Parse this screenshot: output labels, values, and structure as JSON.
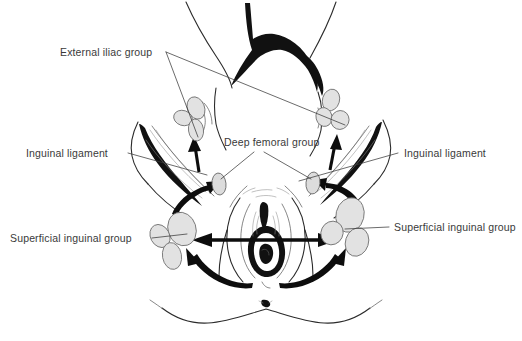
{
  "figure": {
    "background_color": "#ffffff",
    "ink_color": "#2b2b2b",
    "node_fill_color": "#e2e2e2",
    "node_stroke_color": "#6a6a6a",
    "arrow_color": "#0d0d0d",
    "label_color": "#3a3a3a",
    "width": 522,
    "height": 341
  },
  "labels": {
    "external_iliac": "External iliac group",
    "deep_femoral": "Deep femoral group",
    "inguinal_ligament_left": "Inguinal ligament",
    "inguinal_ligament_right": "Inguinal ligament",
    "superficial_inguinal_left": "Superficial inguinal group",
    "superficial_inguinal_right": "Superficial inguinal group"
  },
  "node_groups": [
    {
      "name": "external-iliac-left",
      "label": "External iliac group",
      "side": "left",
      "node_count": 3,
      "nodes": [
        {
          "cx": 196,
          "cy": 108,
          "rx": 8.5,
          "ry": 11.5,
          "rot": -22
        },
        {
          "cx": 183,
          "cy": 118,
          "rx": 9.5,
          "ry": 7.5,
          "rot": 18
        },
        {
          "cx": 196,
          "cy": 130,
          "rx": 7.5,
          "ry": 11.0,
          "rot": -8
        }
      ]
    },
    {
      "name": "external-iliac-right",
      "label": "External iliac group",
      "side": "right",
      "node_count": 3,
      "nodes": [
        {
          "cx": 331,
          "cy": 100,
          "rx": 8.5,
          "ry": 11.0,
          "rot": 16
        },
        {
          "cx": 324,
          "cy": 117,
          "rx": 8.0,
          "ry": 9.5,
          "rot": -14
        },
        {
          "cx": 340,
          "cy": 120,
          "rx": 9.0,
          "ry": 9.5,
          "rot": 22
        }
      ]
    },
    {
      "name": "deep-femoral-left",
      "label": "Deep femoral group",
      "side": "left",
      "node_count": 1,
      "nodes": [
        {
          "cx": 219,
          "cy": 184,
          "rx": 7.0,
          "ry": 11.0,
          "rot": -6
        }
      ]
    },
    {
      "name": "deep-femoral-right",
      "label": "Deep femoral group",
      "side": "right",
      "node_count": 1,
      "nodes": [
        {
          "cx": 313,
          "cy": 183,
          "rx": 7.0,
          "ry": 11.0,
          "rot": 6
        }
      ]
    },
    {
      "name": "superficial-inguinal-left",
      "label": "Superficial inguinal group",
      "side": "left",
      "node_count": 3,
      "nodes": [
        {
          "cx": 182,
          "cy": 229,
          "rx": 14.0,
          "ry": 17.0,
          "rot": -18
        },
        {
          "cx": 160,
          "cy": 236,
          "rx": 9.5,
          "ry": 12.0,
          "rot": -28
        },
        {
          "cx": 172,
          "cy": 256,
          "rx": 9.5,
          "ry": 13.5,
          "rot": -10
        }
      ]
    },
    {
      "name": "superficial-inguinal-right",
      "label": "Superficial inguinal group",
      "side": "right",
      "node_count": 3,
      "nodes": [
        {
          "cx": 350,
          "cy": 215,
          "rx": 14.0,
          "ry": 17.5,
          "rot": 14
        },
        {
          "cx": 332,
          "cy": 233,
          "rx": 11.0,
          "ry": 12.0,
          "rot": 26
        },
        {
          "cx": 357,
          "cy": 242,
          "rx": 11.5,
          "ry": 14.5,
          "rot": 18
        }
      ]
    }
  ],
  "leader_lines": [
    {
      "name": "external-iliac-to-left-nodes",
      "from_x": 166,
      "from_y": 52,
      "to_x": 196,
      "to_y": 136
    },
    {
      "name": "external-iliac-to-right-nodes",
      "from_x": 166,
      "from_y": 52,
      "to_x": 344,
      "to_y": 124
    },
    {
      "name": "deep-femoral-to-left-node",
      "from_x": 252,
      "from_y": 152,
      "to_x": 221,
      "to_y": 180
    },
    {
      "name": "deep-femoral-to-right-node",
      "from_x": 266,
      "from_y": 152,
      "to_x": 311,
      "to_y": 180
    },
    {
      "name": "inguinal-ligament-left-leader",
      "from_x": 128,
      "from_y": 152,
      "to_x": 205,
      "to_y": 173
    },
    {
      "name": "inguinal-ligament-right-leader",
      "from_x": 398,
      "from_y": 152,
      "to_x": 300,
      "to_y": 180
    },
    {
      "name": "superficial-inguinal-left-leader",
      "from_x": 152,
      "from_y": 238,
      "to_x": 186,
      "to_y": 233
    },
    {
      "name": "superficial-inguinal-right-leader",
      "from_x": 388,
      "from_y": 227,
      "to_x": 344,
      "to_y": 229
    }
  ],
  "flow_arrows": [
    {
      "name": "midline-to-left-superficial",
      "type": "straight",
      "direction": "left",
      "from_x": 322,
      "from_y": 240,
      "to_x": 196,
      "to_y": 240
    },
    {
      "name": "midline-to-right-superficial",
      "type": "straight",
      "direction": "right",
      "from_x": 206,
      "from_y": 240,
      "to_x": 334,
      "to_y": 240
    },
    {
      "name": "perineum-to-left-superficial",
      "type": "curved",
      "direction": "left"
    },
    {
      "name": "perineum-to-right-superficial",
      "type": "curved",
      "direction": "right"
    },
    {
      "name": "left-superficial-to-deep-femoral",
      "type": "curved",
      "direction": "up-right"
    },
    {
      "name": "right-superficial-to-deep-femoral",
      "type": "curved",
      "direction": "up-left"
    },
    {
      "name": "left-deep-femoral-to-external-iliac",
      "type": "straight",
      "direction": "up"
    },
    {
      "name": "right-deep-femoral-to-external-iliac",
      "type": "straight",
      "direction": "up"
    }
  ],
  "label_positions": {
    "external_iliac": {
      "x": 60,
      "y": 56
    },
    "deep_femoral": {
      "x": 224,
      "y": 146
    },
    "inguinal_ligament_left": {
      "x": 26,
      "y": 157
    },
    "inguinal_ligament_right": {
      "x": 404,
      "y": 157
    },
    "superficial_inguinal_left": {
      "x": 10,
      "y": 242
    },
    "superficial_inguinal_right": {
      "x": 394,
      "y": 231
    }
  }
}
